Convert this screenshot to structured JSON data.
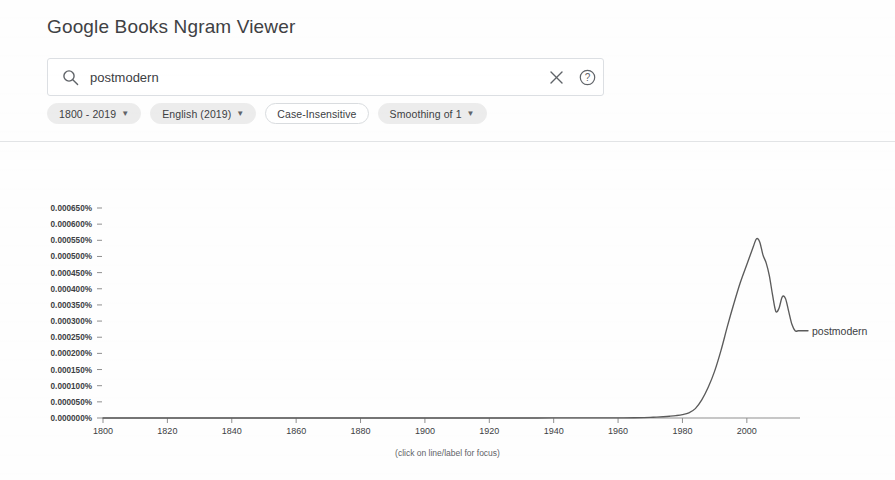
{
  "header": {
    "title": "Google Books Ngram Viewer"
  },
  "search": {
    "value": "postmodern",
    "placeholder": "Search in Google Books Ngram Viewer",
    "search_icon": "search-icon",
    "clear_icon": "close-icon",
    "help_icon": "help-circle-icon"
  },
  "chips": [
    {
      "label": "1800 - 2019",
      "has_caret": true,
      "style": "filled"
    },
    {
      "label": "English (2019)",
      "has_caret": true,
      "style": "filled"
    },
    {
      "label": "Case-Insensitive",
      "has_caret": false,
      "style": "outlined"
    },
    {
      "label": "Smoothing of 1",
      "has_caret": true,
      "style": "filled"
    }
  ],
  "colors": {
    "line": "#5b5b5b",
    "axis": "#8f8f8f",
    "text": "#3c4043",
    "chip_fill": "#ececec",
    "divider": "#e2e4e6"
  },
  "chart_footnote": "(click on line/label for focus)",
  "chart_data": {
    "type": "line",
    "title": "",
    "xlabel": "",
    "ylabel": "",
    "grid": false,
    "legend_position": "line-end",
    "xlim": [
      1800,
      2019
    ],
    "ylim": [
      0.0,
      0.00065
    ],
    "xticks": [
      1800,
      1820,
      1840,
      1860,
      1880,
      1900,
      1920,
      1940,
      1960,
      1980,
      2000
    ],
    "xtick_labels": [
      "1800",
      "1820",
      "1840",
      "1860",
      "1880",
      "1900",
      "1920",
      "1940",
      "1960",
      "1980",
      "2000"
    ],
    "yticks": [
      0.0,
      5e-05,
      0.0001,
      0.00015,
      0.0002,
      0.00025,
      0.0003,
      0.00035,
      0.0004,
      0.00045,
      0.0005,
      0.00055,
      0.0006,
      0.00065
    ],
    "ytick_labels": [
      "0.000000%",
      "0.000050%",
      "0.000100%",
      "0.000150%",
      "0.000200%",
      "0.000250%",
      "0.000300%",
      "0.000350%",
      "0.000400%",
      "0.000450%",
      "0.000500%",
      "0.000550%",
      "0.000600%",
      "0.000650%"
    ],
    "series": [
      {
        "name": "postmodern",
        "label": "postmodern",
        "color": "#5b5b5b",
        "x": [
          1800,
          1820,
          1840,
          1860,
          1880,
          1900,
          1920,
          1930,
          1940,
          1950,
          1955,
          1960,
          1965,
          1968,
          1970,
          1972,
          1974,
          1976,
          1978,
          1980,
          1982,
          1984,
          1986,
          1988,
          1990,
          1992,
          1994,
          1996,
          1998,
          2000,
          2002,
          2003,
          2004,
          2005,
          2006,
          2007,
          2008,
          2009,
          2010,
          2011,
          2012,
          2013,
          2014,
          2015,
          2016,
          2017,
          2018,
          2019
        ],
        "y": [
          0.0,
          0.0,
          0.0,
          0.0,
          0.0,
          0.0,
          1e-07,
          1e-07,
          2e-07,
          3e-07,
          4e-07,
          5e-07,
          8e-07,
          1.2e-06,
          1.8e-06,
          2.8e-06,
          4e-06,
          5.5e-06,
          7.5e-06,
          1.05e-05,
          1.6e-05,
          2.9e-05,
          5.6e-05,
          9.5e-05,
          0.000145,
          0.00021,
          0.000285,
          0.000355,
          0.00042,
          0.000475,
          0.00053,
          0.000555,
          0.000545,
          0.000505,
          0.00048,
          0.00044,
          0.00038,
          0.00033,
          0.00034,
          0.000375,
          0.00037,
          0.00033,
          0.00029,
          0.00027,
          0.00027,
          0.00027,
          0.00027,
          0.00027
        ]
      }
    ]
  }
}
